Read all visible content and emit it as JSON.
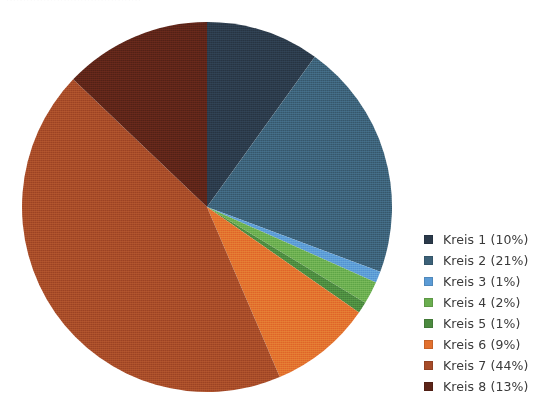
{
  "page": {
    "width": 553,
    "height": 401,
    "background_color": "#ffffff",
    "top_cut_text": "········································"
  },
  "chart_data": {
    "type": "pie",
    "title": "",
    "xlabel": "",
    "ylabel": "",
    "legend_position": "right",
    "grid": false,
    "start_angle_deg": 0,
    "direction": "clockwise",
    "center": {
      "x": 207,
      "y": 207
    },
    "radius": 185,
    "categories": [
      "Kreis 1",
      "Kreis 2",
      "Kreis 3",
      "Kreis 4",
      "Kreis 5",
      "Kreis 6",
      "Kreis 7",
      "Kreis 8"
    ],
    "values": [
      10,
      21,
      1,
      2,
      1,
      9,
      44,
      13
    ],
    "unit": "%",
    "colors": [
      "#2B3A4A",
      "#3C6178",
      "#5B9BD5",
      "#6AAE4F",
      "#4C8A3F",
      "#E2702E",
      "#A64B28",
      "#5C2418"
    ],
    "slices": [
      {
        "label": "Kreis 1",
        "value": 10,
        "color": "#2B3A4A",
        "legend_text": "Kreis 1 (10%)"
      },
      {
        "label": "Kreis 2",
        "value": 21,
        "color": "#3C6178",
        "legend_text": "Kreis 2 (21%)"
      },
      {
        "label": "Kreis 3",
        "value": 1,
        "color": "#5B9BD5",
        "legend_text": "Kreis 3 (1%)"
      },
      {
        "label": "Kreis 4",
        "value": 2,
        "color": "#6AAE4F",
        "legend_text": "Kreis 4 (2%)"
      },
      {
        "label": "Kreis 5",
        "value": 1,
        "color": "#4C8A3F",
        "legend_text": "Kreis 5 (1%)"
      },
      {
        "label": "Kreis 6",
        "value": 9,
        "color": "#E2702E",
        "legend_text": "Kreis 6 (9%)"
      },
      {
        "label": "Kreis 7",
        "value": 44,
        "color": "#A64B28",
        "legend_text": "Kreis 7 (44%)"
      },
      {
        "label": "Kreis 8",
        "value": 13,
        "color": "#5C2418",
        "legend_text": "Kreis 8 (13%)"
      }
    ]
  },
  "legend": {
    "items": [
      {
        "label": "Kreis 1 (10%)",
        "color": "#2B3A4A"
      },
      {
        "label": "Kreis 2 (21%)",
        "color": "#3C6178"
      },
      {
        "label": "Kreis 3 (1%)",
        "color": "#5B9BD5"
      },
      {
        "label": "Kreis 4 (2%)",
        "color": "#6AAE4F"
      },
      {
        "label": "Kreis 5 (1%)",
        "color": "#4C8A3F"
      },
      {
        "label": "Kreis 6 (9%)",
        "color": "#E2702E"
      },
      {
        "label": "Kreis 7 (44%)",
        "color": "#A64B28"
      },
      {
        "label": "Kreis 8 (13%)",
        "color": "#5C2418"
      }
    ]
  }
}
